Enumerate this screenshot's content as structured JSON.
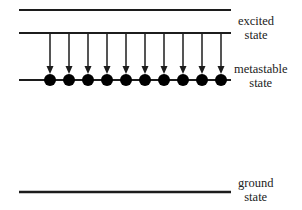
{
  "figure": {
    "type": "energy-level-diagram",
    "title": "",
    "background_color": "#ffffff",
    "line_color": "#1c1c1c",
    "dot_color": "#000000",
    "arrow_color": "#1c1c1c",
    "text_color": "#222222"
  },
  "levels": [
    {
      "id": "pump-level",
      "label_line1": "",
      "label_line2": "",
      "y": 10,
      "x_start": 19,
      "x_end": 231,
      "thickness": 2.2
    },
    {
      "id": "excited-level",
      "label_line1": "excited",
      "label_line2": "state",
      "y": 33,
      "x_start": 19,
      "x_end": 231,
      "thickness": 2.2
    },
    {
      "id": "metastable-level",
      "label_line1": "metastable",
      "label_line2": "state",
      "y": 80,
      "x_start": 19,
      "x_end": 231,
      "thickness": 2.2
    },
    {
      "id": "ground-level",
      "label_line1": "ground",
      "label_line2": "state",
      "y": 192,
      "x_start": 19,
      "x_end": 231,
      "thickness": 2.6
    }
  ],
  "labels": {
    "excited": {
      "line1": "excited",
      "line2": "state"
    },
    "metastable": {
      "line1": "metastable",
      "line2": "state"
    },
    "ground": {
      "line1": "ground",
      "line2": "state"
    }
  },
  "transitions": {
    "count": 10,
    "direction": "down",
    "from_y": 34,
    "to_y": 74,
    "x_positions": [
      50,
      69,
      88,
      107,
      126,
      145,
      164,
      183,
      202,
      221
    ],
    "shaft_width": 1.5,
    "head_width": 7,
    "head_height": 8
  },
  "particles": {
    "count": 10,
    "radius": 6,
    "y": 80,
    "x_positions": [
      50,
      69,
      88,
      107,
      126,
      145,
      164,
      183,
      202,
      221
    ]
  }
}
